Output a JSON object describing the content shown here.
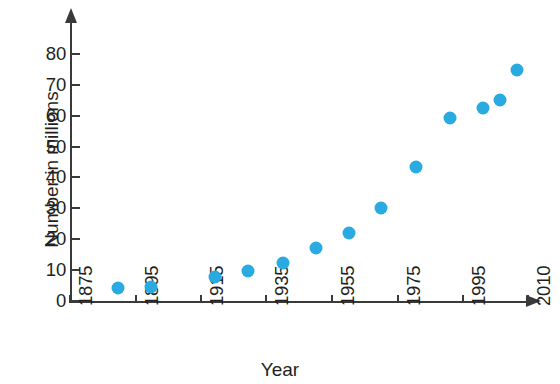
{
  "chart_data": {
    "type": "scatter",
    "title": "",
    "xlabel": "Year",
    "ylabel": "Number in millions",
    "x": [
      1890,
      1900,
      1920,
      1930,
      1940,
      1950,
      1960,
      1970,
      1980,
      1991,
      2001,
      2005,
      2010
    ],
    "values": [
      4,
      5,
      8,
      10,
      12.5,
      16,
      22,
      30,
      43.5,
      58,
      62,
      64.5,
      74
    ],
    "points": [
      {
        "x": 1890,
        "y": 4
      },
      {
        "x": 1900,
        "y": 5
      },
      {
        "x": 1920,
        "y": 8
      },
      {
        "x": 1930,
        "y": 10
      },
      {
        "x": 1940,
        "y": 12.5
      },
      {
        "x": 1950,
        "y": 16
      },
      {
        "x": 1960,
        "y": 22
      },
      {
        "x": 1970,
        "y": 30
      },
      {
        "x": 1980,
        "y": 43.5
      },
      {
        "x": 1991,
        "y": 58
      },
      {
        "x": 2001,
        "y": 62
      },
      {
        "x": 2005,
        "y": 64.5
      },
      {
        "x": 2010,
        "y": 74
      }
    ],
    "xticks": [
      "1875",
      "1895",
      "1915",
      "1935",
      "1955",
      "1975",
      "1995",
      "2010"
    ],
    "yticks": [
      "0",
      "10",
      "20",
      "30",
      "40",
      "50",
      "60",
      "70",
      "80"
    ],
    "xlim": [
      1875,
      2015
    ],
    "ylim": [
      0,
      85
    ],
    "grid": false,
    "legend": false,
    "marker_color": "#29ABE2",
    "axis_color": "#3a3a3a"
  },
  "axes": {
    "y_title": "Number in millions",
    "x_title": "Year",
    "y_ticks": [
      {
        "label": "0",
        "px": 301
      },
      {
        "label": "10",
        "px": 270
      },
      {
        "label": "20",
        "px": 239
      },
      {
        "label": "30",
        "px": 208
      },
      {
        "label": "40",
        "px": 177
      },
      {
        "label": "50",
        "px": 147
      },
      {
        "label": "60",
        "px": 116
      },
      {
        "label": "70",
        "px": 85
      },
      {
        "label": "80",
        "px": 54
      }
    ],
    "x_ticks": [
      {
        "label": "1875",
        "px": 70
      },
      {
        "label": "1895",
        "px": 136
      },
      {
        "label": "1915",
        "px": 201
      },
      {
        "label": "1935",
        "px": 266
      },
      {
        "label": "1955",
        "px": 332
      },
      {
        "label": "1975",
        "px": 398
      },
      {
        "label": "1995",
        "px": 463
      },
      {
        "label": "2010",
        "px": 528
      }
    ]
  },
  "markers": [
    {
      "cx": 118,
      "cy": 288
    },
    {
      "cx": 151,
      "cy": 287
    },
    {
      "cx": 215,
      "cy": 277
    },
    {
      "cx": 248,
      "cy": 271
    },
    {
      "cx": 283,
      "cy": 263
    },
    {
      "cx": 316,
      "cy": 248
    },
    {
      "cx": 349,
      "cy": 233
    },
    {
      "cx": 381,
      "cy": 208
    },
    {
      "cx": 416,
      "cy": 167
    },
    {
      "cx": 450,
      "cy": 118
    },
    {
      "cx": 483,
      "cy": 108
    },
    {
      "cx": 500,
      "cy": 100
    },
    {
      "cx": 517,
      "cy": 70
    }
  ]
}
